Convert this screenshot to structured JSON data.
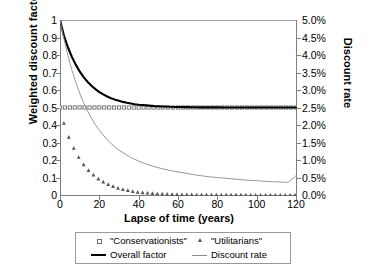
{
  "chart_data": {
    "type": "line",
    "title": "",
    "xlabel": "Lapse of time (years)",
    "ylabel": "Weighted discount factors",
    "ylabel_right": "Discount rate",
    "xlim": [
      0,
      120
    ],
    "ylim": [
      0,
      1
    ],
    "ylim_right": [
      0,
      0.05
    ],
    "grid": false,
    "legend_position": "bottom",
    "xticks": [
      "0",
      "20",
      "40",
      "60",
      "80",
      "100",
      "120"
    ],
    "xtick_values": [
      0,
      20,
      40,
      60,
      80,
      100,
      120
    ],
    "yticks_left": [
      "0",
      "0.1",
      "0.2",
      "0.3",
      "0.4",
      "0.5",
      "0.6",
      "0.7",
      "0.8",
      "0.9",
      "1"
    ],
    "ytick_values_left": [
      0,
      0.1,
      0.2,
      0.3,
      0.4,
      0.5,
      0.6,
      0.7,
      0.8,
      0.9,
      1
    ],
    "yticks_right": [
      "0.0%",
      "0.5%",
      "1.0%",
      "1.5%",
      "2.0%",
      "2.5%",
      "3.0%",
      "3.5%",
      "4.0%",
      "4.5%",
      "5.0%"
    ],
    "ytick_values_right": [
      0,
      0.005,
      0.01,
      0.015,
      0.02,
      0.025,
      0.03,
      0.035,
      0.04,
      0.045,
      0.05
    ],
    "x": [
      0,
      2,
      4,
      6,
      8,
      10,
      12,
      14,
      16,
      18,
      20,
      22,
      24,
      26,
      28,
      30,
      32,
      34,
      36,
      38,
      40,
      44,
      48,
      52,
      56,
      60,
      64,
      68,
      72,
      76,
      80,
      84,
      88,
      92,
      96,
      100,
      104,
      108,
      112,
      116,
      120
    ],
    "series": [
      {
        "name": "\"Conservationists\"",
        "axis": "left",
        "style": "markers",
        "marker": "open-square",
        "color": "#6e6e6e",
        "values": [
          0.5,
          0.5,
          0.5,
          0.5,
          0.5,
          0.5,
          0.5,
          0.5,
          0.5,
          0.5,
          0.5,
          0.5,
          0.5,
          0.5,
          0.5,
          0.5,
          0.5,
          0.5,
          0.5,
          0.5,
          0.5,
          0.5,
          0.5,
          0.5,
          0.5,
          0.5,
          0.5,
          0.5,
          0.5,
          0.5,
          0.5,
          0.5,
          0.5,
          0.5,
          0.5,
          0.5,
          0.5,
          0.5,
          0.5,
          0.5,
          0.5
        ]
      },
      {
        "name": "\"Utilitarians\"",
        "axis": "left",
        "style": "markers",
        "marker": "filled-triangle",
        "color": "#555555",
        "values": [
          0.5,
          0.41,
          0.345,
          0.29,
          0.245,
          0.206,
          0.174,
          0.147,
          0.124,
          0.105,
          0.088,
          0.075,
          0.063,
          0.053,
          0.045,
          0.038,
          0.032,
          0.027,
          0.023,
          0.019,
          0.016,
          0.012,
          0.008,
          0.006,
          0.004,
          0.003,
          0.002,
          0.0015,
          0.001,
          0.0008,
          0.0005,
          0.0004,
          0.0003,
          0.0002,
          0.00015,
          0.0001,
          8e-05,
          5e-05,
          4e-05,
          3e-05,
          2e-05
        ]
      },
      {
        "name": "Overall factor",
        "axis": "left",
        "style": "line-thick",
        "color": "#000000",
        "values": [
          1.0,
          0.91,
          0.845,
          0.79,
          0.745,
          0.706,
          0.674,
          0.647,
          0.624,
          0.605,
          0.588,
          0.575,
          0.563,
          0.553,
          0.545,
          0.538,
          0.532,
          0.527,
          0.523,
          0.519,
          0.516,
          0.512,
          0.508,
          0.506,
          0.504,
          0.503,
          0.502,
          0.5015,
          0.501,
          0.5008,
          0.5005,
          0.5004,
          0.5003,
          0.5002,
          0.50015,
          0.5001,
          0.50008,
          0.50005,
          0.50004,
          0.50003,
          0.50002
        ]
      },
      {
        "name": "Discount rate",
        "axis": "right",
        "style": "line-thin",
        "color": "#8c8c8c",
        "values": [
          0.05,
          0.0446,
          0.0399,
          0.0358,
          0.0322,
          0.0291,
          0.0264,
          0.024,
          0.0219,
          0.0201,
          0.0185,
          0.0171,
          0.0158,
          0.0147,
          0.0137,
          0.0128,
          0.0121,
          0.0114,
          0.0107,
          0.0102,
          0.0097,
          0.0088,
          0.0081,
          0.0075,
          0.007,
          0.0066,
          0.0062,
          0.0058,
          0.0055,
          0.0052,
          0.005,
          0.0048,
          0.0046,
          0.0044,
          0.0042,
          0.0041,
          0.0039,
          0.0038,
          0.0037,
          0.0036,
          0.0055
        ]
      }
    ]
  },
  "legend": {
    "entries": [
      {
        "label": "\"Conservationists\"",
        "marker": "open-square"
      },
      {
        "label": "\"Utilitarians\"",
        "marker": "filled-triangle"
      },
      {
        "label": "Overall factor",
        "marker": "thick-black-line"
      },
      {
        "label": "Discount rate",
        "marker": "thin-gray-line"
      }
    ]
  },
  "colors": {
    "overall_factor": "#000000",
    "discount_rate": "#8c8c8c",
    "conservationists": "#6e6e6e",
    "utilitarians": "#555555",
    "axis": "#808080",
    "background": "#ffffff"
  }
}
